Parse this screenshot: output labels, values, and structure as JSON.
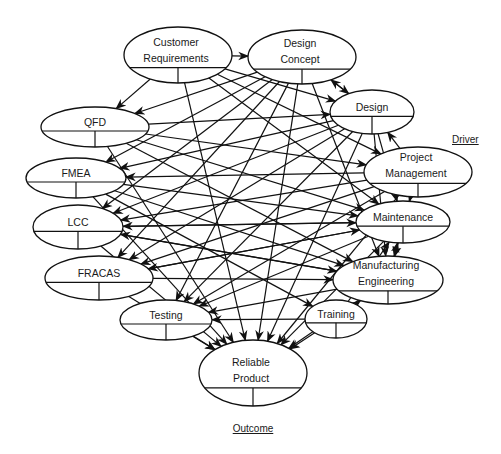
{
  "diagram": {
    "title": "",
    "colors": {
      "stroke": "#111111",
      "background": "#ffffff",
      "text": "#1a1a1a"
    },
    "labels": {
      "driver": "Driver",
      "outcome": "Outcome"
    },
    "nodes": [
      {
        "id": "cr",
        "lines": [
          "Customer",
          "Requirements"
        ],
        "cx": 178,
        "cy": 55,
        "rx": 54,
        "ry": 28
      },
      {
        "id": "dc",
        "lines": [
          "Design",
          "Concept"
        ],
        "cx": 302,
        "cy": 57,
        "rx": 54,
        "ry": 27
      },
      {
        "id": "qfd",
        "lines": [
          "QFD"
        ],
        "cx": 95,
        "cy": 127,
        "rx": 54,
        "ry": 20
      },
      {
        "id": "des",
        "lines": [
          "Design"
        ],
        "cx": 372,
        "cy": 112,
        "rx": 42,
        "ry": 22
      },
      {
        "id": "fmea",
        "lines": [
          "FMEA"
        ],
        "cx": 76,
        "cy": 178,
        "rx": 50,
        "ry": 20
      },
      {
        "id": "pm",
        "lines": [
          "Project",
          "Management"
        ],
        "cx": 418,
        "cy": 172,
        "rx": 54,
        "ry": 25
      },
      {
        "id": "lcc",
        "lines": [
          "LCC"
        ],
        "cx": 78,
        "cy": 227,
        "rx": 45,
        "ry": 22
      },
      {
        "id": "mnt",
        "lines": [
          "Maintenance"
        ],
        "cx": 403,
        "cy": 222,
        "rx": 47,
        "ry": 21
      },
      {
        "id": "frc",
        "lines": [
          "FRACAS"
        ],
        "cx": 99,
        "cy": 278,
        "rx": 54,
        "ry": 22
      },
      {
        "id": "mfg",
        "lines": [
          "Manufacturing",
          "Engineering"
        ],
        "cx": 388,
        "cy": 280,
        "rx": 55,
        "ry": 24
      },
      {
        "id": "tst",
        "lines": [
          "Testing"
        ],
        "cx": 166,
        "cy": 320,
        "rx": 46,
        "ry": 20
      },
      {
        "id": "trn",
        "lines": [
          "Training"
        ],
        "cx": 336,
        "cy": 319,
        "rx": 31,
        "ry": 19
      },
      {
        "id": "rp",
        "lines": [
          "Reliable",
          "Product"
        ],
        "cx": 253,
        "cy": 373,
        "rx": 54,
        "ry": 33
      }
    ],
    "edges": [
      [
        "cr",
        "dc"
      ],
      [
        "cr",
        "qfd"
      ],
      [
        "cr",
        "des"
      ],
      [
        "cr",
        "pm"
      ],
      [
        "cr",
        "rp"
      ],
      [
        "cr",
        "mnt"
      ],
      [
        "dc",
        "des"
      ],
      [
        "dc",
        "qfd"
      ],
      [
        "dc",
        "fmea"
      ],
      [
        "dc",
        "lcc"
      ],
      [
        "dc",
        "frc"
      ],
      [
        "dc",
        "tst"
      ],
      [
        "dc",
        "rp"
      ],
      [
        "dc",
        "mfg"
      ],
      [
        "des",
        "dc"
      ],
      [
        "des",
        "lcc"
      ],
      [
        "des",
        "fmea"
      ],
      [
        "des",
        "frc"
      ],
      [
        "des",
        "tst"
      ],
      [
        "des",
        "rp"
      ],
      [
        "des",
        "mnt"
      ],
      [
        "des",
        "mfg"
      ],
      [
        "qfd",
        "des"
      ],
      [
        "qfd",
        "mnt"
      ],
      [
        "qfd",
        "mfg"
      ],
      [
        "qfd",
        "rp"
      ],
      [
        "qfd",
        "pm"
      ],
      [
        "pm",
        "des"
      ],
      [
        "pm",
        "fmea"
      ],
      [
        "pm",
        "lcc"
      ],
      [
        "pm",
        "frc"
      ],
      [
        "pm",
        "tst"
      ],
      [
        "pm",
        "rp"
      ],
      [
        "pm",
        "mnt"
      ],
      [
        "pm",
        "mfg"
      ],
      [
        "fmea",
        "mnt"
      ],
      [
        "fmea",
        "mfg"
      ],
      [
        "fmea",
        "rp"
      ],
      [
        "fmea",
        "trn"
      ],
      [
        "lcc",
        "mnt"
      ],
      [
        "lcc",
        "rp"
      ],
      [
        "lcc",
        "mfg"
      ],
      [
        "mnt",
        "lcc"
      ],
      [
        "mnt",
        "frc"
      ],
      [
        "mnt",
        "tst"
      ],
      [
        "mnt",
        "rp"
      ],
      [
        "mnt",
        "mfg"
      ],
      [
        "frc",
        "mnt"
      ],
      [
        "frc",
        "mfg"
      ],
      [
        "frc",
        "rp"
      ],
      [
        "mfg",
        "mnt"
      ],
      [
        "mfg",
        "tst"
      ],
      [
        "mfg",
        "rp"
      ],
      [
        "mfg",
        "lcc"
      ],
      [
        "trn",
        "tst"
      ],
      [
        "trn",
        "rp"
      ],
      [
        "trn",
        "mnt"
      ],
      [
        "trn",
        "mfg"
      ],
      [
        "tst",
        "rp"
      ]
    ]
  }
}
